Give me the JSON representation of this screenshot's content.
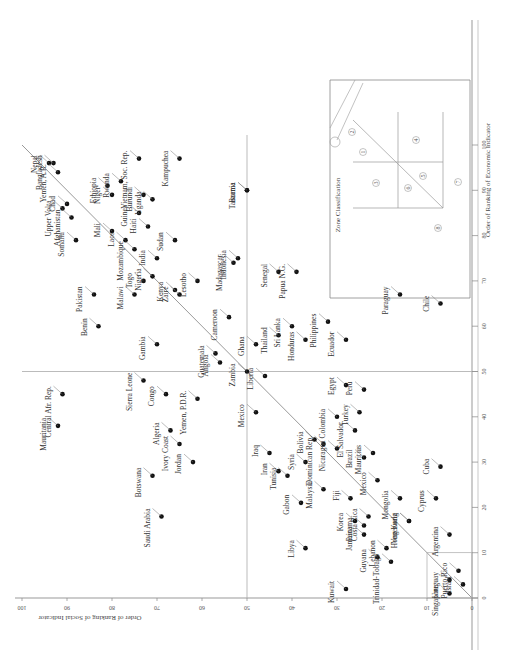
{
  "chart_data": {
    "type": "scatter",
    "title": "",
    "orientation_note_visible": "rotated 90 degrees",
    "xlabel": "Order of Ranking of Economic Indicator",
    "ylabel": "Order of Ranking of Social Indicator",
    "xlim": [
      0,
      100
    ],
    "ylim": [
      0,
      100
    ],
    "x_ticks": [
      0,
      10,
      20,
      30,
      40,
      50,
      60,
      70,
      80,
      90,
      100
    ],
    "y_ticks": [
      0,
      10,
      20,
      30,
      40,
      50,
      60,
      70,
      80,
      90,
      100
    ],
    "x_tick_labels": [
      "0",
      "10",
      "20",
      "30",
      "40",
      "50",
      "60",
      "70",
      "80",
      "90",
      "100"
    ],
    "y_tick_labels": [
      "0",
      "10",
      "20",
      "30",
      "40",
      "50",
      "60",
      "70",
      "80",
      "90",
      "100"
    ],
    "reference_lines": [
      {
        "type": "diagonal",
        "from": [
          0,
          0
        ],
        "to": [
          100,
          100
        ]
      },
      {
        "type": "vertical",
        "x": 50
      },
      {
        "type": "horizontal",
        "y": 50
      },
      {
        "type": "box",
        "x": [
          0,
          10
        ],
        "y": [
          0,
          10
        ]
      }
    ],
    "points": [
      {
        "label": "Nepal",
        "x": 96,
        "y": 94
      },
      {
        "label": "Bangladesh",
        "x": 96,
        "y": 93
      },
      {
        "label": "Yemen, A.R.",
        "x": 94,
        "y": 92
      },
      {
        "label": "Chad",
        "x": 87,
        "y": 90
      },
      {
        "label": "Upper Volta",
        "x": 86,
        "y": 91
      },
      {
        "label": "Afghanistan",
        "x": 84,
        "y": 89
      },
      {
        "label": "Somalia",
        "x": 79,
        "y": 88
      },
      {
        "label": "Mali",
        "x": 81,
        "y": 80
      },
      {
        "label": "Ethiopia",
        "x": 91,
        "y": 81
      },
      {
        "label": "Rwanda",
        "x": 92,
        "y": 78
      },
      {
        "label": "Niger",
        "x": 89,
        "y": 80
      },
      {
        "label": "Vietnam, Soc. Rep.",
        "x": 97,
        "y": 74
      },
      {
        "label": "Burundi",
        "x": 89,
        "y": 73
      },
      {
        "label": "Guinea",
        "x": 85,
        "y": 74
      },
      {
        "label": "Uganda",
        "x": 88,
        "y": 71
      },
      {
        "label": "Haiti",
        "x": 82,
        "y": 72
      },
      {
        "label": "India",
        "x": 75,
        "y": 70
      },
      {
        "label": "Sudan",
        "x": 79,
        "y": 66
      },
      {
        "label": "Kampuchea",
        "x": 97,
        "y": 65
      },
      {
        "label": "Laos",
        "x": 79,
        "y": 77
      },
      {
        "label": "Mozambique",
        "x": 77,
        "y": 75
      },
      {
        "label": "Pakistan",
        "x": 67,
        "y": 84
      },
      {
        "label": "Togo",
        "x": 70,
        "y": 73
      },
      {
        "label": "Malawi",
        "x": 67,
        "y": 75
      },
      {
        "label": "Nigeria",
        "x": 71,
        "y": 71
      },
      {
        "label": "Kenya",
        "x": 68,
        "y": 66
      },
      {
        "label": "Zaire",
        "x": 67,
        "y": 65
      },
      {
        "label": "Lesotho",
        "x": 70,
        "y": 61
      },
      {
        "label": "Benin",
        "x": 60,
        "y": 83
      },
      {
        "label": "Gambia",
        "x": 56,
        "y": 70
      },
      {
        "label": "Guatemala",
        "x": 54,
        "y": 57
      },
      {
        "label": "Angola",
        "x": 52,
        "y": 56
      },
      {
        "label": "Cameroon",
        "x": 62,
        "y": 54
      },
      {
        "label": "Madagascar",
        "x": 74,
        "y": 53
      },
      {
        "label": "Indonesia",
        "x": 75,
        "y": 52
      },
      {
        "label": "Burma",
        "x": 90,
        "y": 50
      },
      {
        "label": "Tanzania",
        "x": 90,
        "y": 50
      },
      {
        "label": "Zambia",
        "x": 50,
        "y": 50
      },
      {
        "label": "Ghana",
        "x": 56,
        "y": 48
      },
      {
        "label": "Thailand",
        "x": 58,
        "y": 43
      },
      {
        "label": "Sri Lanka",
        "x": 60,
        "y": 40
      },
      {
        "label": "Honduras",
        "x": 57,
        "y": 37
      },
      {
        "label": "Senegal",
        "x": 72,
        "y": 43
      },
      {
        "label": "Papua N.G.",
        "x": 72,
        "y": 39
      },
      {
        "label": "Philippines",
        "x": 61,
        "y": 32
      },
      {
        "label": "Ecuador",
        "x": 57,
        "y": 28
      },
      {
        "label": "Paraguay",
        "x": 67,
        "y": 16
      },
      {
        "label": "Chile",
        "x": 65,
        "y": 7
      },
      {
        "label": "Mauritania",
        "x": 38,
        "y": 92
      },
      {
        "label": "Central Afr. Rep.",
        "x": 45,
        "y": 91
      },
      {
        "label": "Sierra Leone",
        "x": 48,
        "y": 73
      },
      {
        "label": "Congo",
        "x": 45,
        "y": 68
      },
      {
        "label": "Algeria",
        "x": 37,
        "y": 67
      },
      {
        "label": "Yemen, P.D.R.",
        "x": 44,
        "y": 61
      },
      {
        "label": "Ivory Coast",
        "x": 34,
        "y": 65
      },
      {
        "label": "Botswana",
        "x": 27,
        "y": 71
      },
      {
        "label": "Jordan",
        "x": 30,
        "y": 62
      },
      {
        "label": "Saudi Arabia",
        "x": 18,
        "y": 69
      },
      {
        "label": "Liberia",
        "x": 49,
        "y": 46
      },
      {
        "label": "Mexico",
        "x": 41,
        "y": 48
      },
      {
        "label": "Bolivia",
        "x": 35,
        "y": 35
      },
      {
        "label": "Dominican Rep.",
        "x": 34,
        "y": 33
      },
      {
        "label": "Colombia",
        "x": 40,
        "y": 30
      },
      {
        "label": "Nicaragua",
        "x": 33,
        "y": 30
      },
      {
        "label": "El Salvador",
        "x": 37,
        "y": 26
      },
      {
        "label": "Egypt",
        "x": 47,
        "y": 28
      },
      {
        "label": "Peru",
        "x": 46,
        "y": 24
      },
      {
        "label": "Turkey",
        "x": 41,
        "y": 25
      },
      {
        "label": "Brazil",
        "x": 31,
        "y": 24
      },
      {
        "label": "Mauritius",
        "x": 32,
        "y": 22
      },
      {
        "label": "Mexico (2)",
        "x": 26,
        "y": 21
      },
      {
        "label": "Mongolia",
        "x": 22,
        "y": 16
      },
      {
        "label": "Iraq",
        "x": 32,
        "y": 45
      },
      {
        "label": "Iran",
        "x": 28,
        "y": 43
      },
      {
        "label": "Syria",
        "x": 30,
        "y": 37
      },
      {
        "label": "Tunisia",
        "x": 27,
        "y": 41
      },
      {
        "label": "Gabon",
        "x": 21,
        "y": 38
      },
      {
        "label": "Libya",
        "x": 11,
        "y": 37
      },
      {
        "label": "Costa Rica",
        "x": 18,
        "y": 23
      },
      {
        "label": "Fiji",
        "x": 22,
        "y": 27
      },
      {
        "label": "Malaysia",
        "x": 24,
        "y": 33
      },
      {
        "label": "Korea",
        "x": 17,
        "y": 26
      },
      {
        "label": "Panama",
        "x": 16,
        "y": 24
      },
      {
        "label": "Jamaica",
        "x": 14,
        "y": 24
      },
      {
        "label": "Lebanon",
        "x": 11,
        "y": 19
      },
      {
        "label": "Guyana",
        "x": 9,
        "y": 21
      },
      {
        "label": "Trinidad-Tobago",
        "x": 8,
        "y": 18
      },
      {
        "label": "Kuwait",
        "x": 2,
        "y": 28
      },
      {
        "label": "Singapore",
        "x": 1,
        "y": 5
      },
      {
        "label": "Uruguay",
        "x": 4,
        "y": 5
      },
      {
        "label": "Hong Kong",
        "x": 17,
        "y": 14
      },
      {
        "label": "Venezuela",
        "x": 17,
        "y": 14
      },
      {
        "label": "Puerto Rico",
        "x": 6,
        "y": 3
      },
      {
        "label": "Cyprus",
        "x": 22,
        "y": 8
      },
      {
        "label": "Cuba",
        "x": 29,
        "y": 7
      },
      {
        "label": "Argentina",
        "x": 14,
        "y": 5
      },
      {
        "label": "Israel",
        "x": 3,
        "y": 2
      }
    ],
    "inset": {
      "title": "Zone Classification",
      "axis_ticks": [
        "0",
        "10",
        "50",
        "100"
      ],
      "zones": [
        "1",
        "2",
        "3",
        "4",
        "5",
        "6",
        "7",
        "8"
      ]
    },
    "grid": false,
    "legend": "none"
  }
}
